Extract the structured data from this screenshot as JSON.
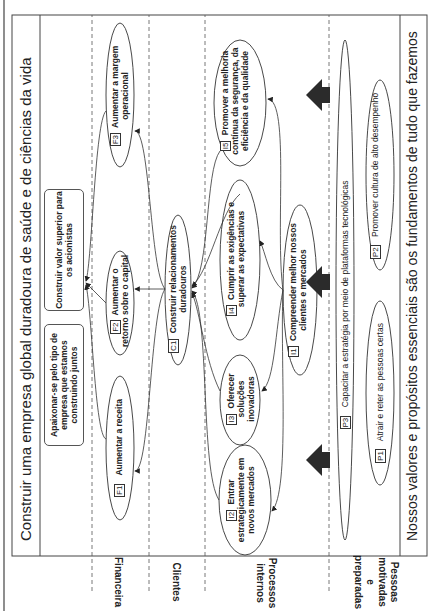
{
  "header": {
    "title": "Construir uma empresa global duradoura de saúde e de ciências da vida"
  },
  "vision": {
    "box1": "Apaixonar-se pelo tipo de empresa que estamos construindo juntos",
    "box2": "Construir valor superior para os acionistas"
  },
  "perspectives": [
    {
      "label": "Financeira"
    },
    {
      "label": "Clientes"
    },
    {
      "label": "Processos internos"
    },
    {
      "label": "Pessoas motivadas e preparadas"
    }
  ],
  "objectives": {
    "F1": {
      "code": "F1",
      "text": "Aumentar a receita"
    },
    "F2": {
      "code": "F2",
      "text": "Aumentar o retorno sobre o capital"
    },
    "F3": {
      "code": "F3",
      "text": "Aumentar a margem operacional"
    },
    "C1": {
      "code": "C1",
      "text": "Construir relacionamentos duradouros"
    },
    "I1": {
      "code": "I1",
      "text": "Compreender melhor nossos clientes e mercados"
    },
    "I2": {
      "code": "I2",
      "text": "Entrar estrategicamente em novos mercados"
    },
    "I3": {
      "code": "I3",
      "text": "Oferecer soluções inovadoras"
    },
    "I4": {
      "code": "I4",
      "text": "Cumprir as exigências e superar as expectativas"
    },
    "I5": {
      "code": "I5",
      "text": "Promover a melhoria contínua da segurança, da eficiência e da qualidade"
    },
    "P1": {
      "code": "P1",
      "text": "Atrair e reter as pessoas certas"
    },
    "P2": {
      "code": "P2",
      "text": "Promover cultura de alto desempenho"
    },
    "P3": {
      "code": "P3",
      "text": "Capacitar a estratégia por meio de plataformas tecnológicas"
    }
  },
  "footer": {
    "text": "Nossos valores e propósitos essenciais são os fundamentos de tudo que fazemos"
  },
  "colors": {
    "line": "#333333",
    "dashed": "#555555",
    "big_arrow": "#2b2b2b"
  }
}
